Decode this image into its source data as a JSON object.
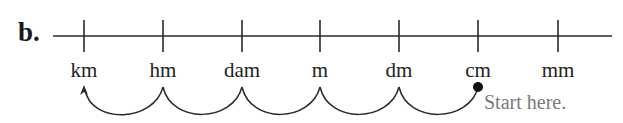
{
  "problem_label": "b.",
  "units": [
    {
      "label": "km",
      "x": 84
    },
    {
      "label": "hm",
      "x": 163
    },
    {
      "label": "dam",
      "x": 242
    },
    {
      "label": "m",
      "x": 320
    },
    {
      "label": "dm",
      "x": 399
    },
    {
      "label": "cm",
      "x": 478
    },
    {
      "label": "mm",
      "x": 558
    }
  ],
  "start_note": "Start here.",
  "start_unit": "cm",
  "end_unit": "km",
  "colors": {
    "line": "#2a2a2a",
    "note": "#7a7a7a"
  }
}
